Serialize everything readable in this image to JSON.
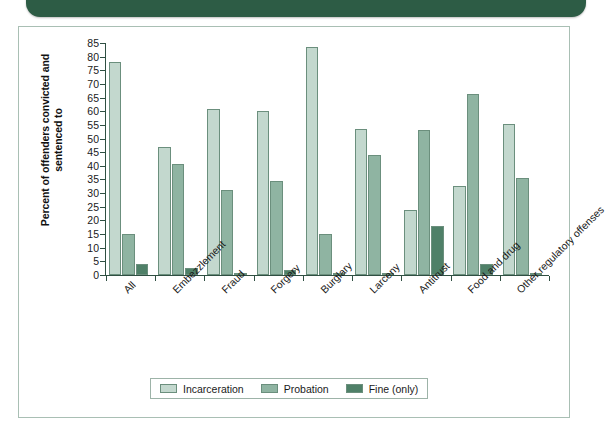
{
  "banner": {
    "color": "#2d5c45",
    "label": ""
  },
  "figure": {
    "border_color": "#a9bfb4",
    "background": "#ffffff"
  },
  "chart_data": {
    "type": "bar",
    "title": "",
    "xlabel": "",
    "ylabel": "Percent of offenders convicted and sentenced to",
    "ylim": [
      0,
      85
    ],
    "ytick_step": 5,
    "yticks": [
      0,
      5,
      10,
      15,
      20,
      25,
      30,
      35,
      40,
      45,
      50,
      55,
      60,
      65,
      70,
      75,
      80,
      85
    ],
    "grid": false,
    "legend_position": "bottom-center",
    "categories": [
      "All",
      "Embezzlement",
      "Fraud",
      "Forgery",
      "Burglary",
      "Larceny",
      "Antitrust",
      "Food and drug",
      "Other regulatory offenses"
    ],
    "series": [
      {
        "name": "Incarceration",
        "color": "#c3d8ce",
        "values": [
          78,
          47,
          61,
          60,
          83.5,
          53.5,
          24,
          32.5,
          55.5
        ]
      },
      {
        "name": "Probation",
        "color": "#8fb4a2",
        "values": [
          15,
          40.5,
          31,
          34.5,
          15,
          44,
          53,
          66.5,
          35.5
        ]
      },
      {
        "name": "Fine (only)",
        "color": "#4f8068",
        "values": [
          4,
          2.5,
          0.7,
          1.8,
          0.2,
          0.3,
          18,
          4,
          0.5
        ]
      }
    ]
  },
  "legend": {
    "items": [
      {
        "label": "Incarceration",
        "color": "#c3d8ce"
      },
      {
        "label": "Probation",
        "color": "#8fb4a2"
      },
      {
        "label": "Fine (only)",
        "color": "#4f8068"
      }
    ]
  }
}
